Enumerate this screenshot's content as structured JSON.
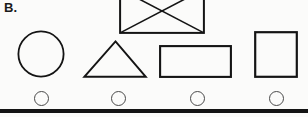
{
  "page": {
    "background_color": "#fbfbfa",
    "ink_color": "#141414",
    "bubble_color": "#4a4a4a",
    "width": 308,
    "height": 117
  },
  "question": {
    "label": "B."
  },
  "shapes": [
    {
      "name": "circle",
      "icon": "circle-shape",
      "description": "Circle outline",
      "x": 17,
      "y": 30,
      "width": 48,
      "height": 48
    },
    {
      "name": "triangle",
      "icon": "triangle-shape",
      "description": "Triangle outline",
      "x": 83,
      "y": 40,
      "width": 64,
      "height": 38
    },
    {
      "name": "envelope",
      "icon": "envelope-shape",
      "description": "Rectangle with crossed diagonals, cropped at top edge",
      "x": 119,
      "y": -12,
      "width": 86,
      "height": 46
    },
    {
      "name": "rectangle",
      "icon": "rectangle-shape",
      "description": "Horizontal rectangle outline",
      "x": 159,
      "y": 45,
      "width": 73,
      "height": 33
    },
    {
      "name": "square",
      "icon": "square-shape",
      "description": "Square outline",
      "x": 254,
      "y": 31,
      "width": 44,
      "height": 47
    }
  ],
  "answer_bubbles": [
    {
      "name": "bubble-a",
      "x": 34,
      "y": 91,
      "selected": false
    },
    {
      "name": "bubble-b",
      "x": 111,
      "y": 91,
      "selected": false
    },
    {
      "name": "bubble-c",
      "x": 190,
      "y": 91,
      "selected": false
    },
    {
      "name": "bubble-d",
      "x": 269,
      "y": 91,
      "selected": false
    }
  ],
  "divider": {
    "name": "bottom-rule",
    "x": 0,
    "y": 109,
    "width": 308,
    "height": 4
  }
}
